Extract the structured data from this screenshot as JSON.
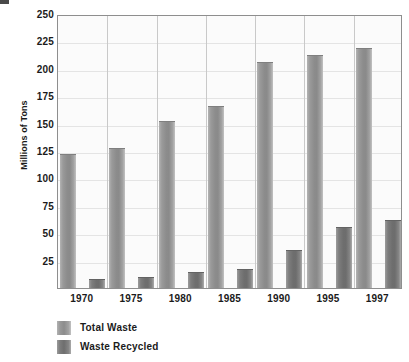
{
  "chart_data": {
    "type": "bar",
    "title": "",
    "xlabel": "",
    "ylabel": "Millions of Tons",
    "categories": [
      "1970",
      "1975",
      "1980",
      "1985",
      "1990",
      "1995",
      "1997"
    ],
    "series": [
      {
        "name": "Total Waste",
        "color": "#8c8c8c",
        "values": [
          122,
          128,
          152,
          166,
          206,
          213,
          219
        ]
      },
      {
        "name": "Waste Recycled",
        "color": "#6e6e6e",
        "values": [
          8,
          10,
          15,
          17,
          35,
          56,
          62
        ]
      }
    ],
    "ylim": [
      0,
      250
    ],
    "yticks": [
      250,
      225,
      200,
      175,
      150,
      125,
      100,
      75,
      50,
      25
    ],
    "ytick_labels": [
      "250",
      "225",
      "200",
      "175",
      "150",
      "125",
      "100",
      "75",
      "50",
      "25"
    ],
    "grid": true,
    "legend_position": "below-left",
    "plot_background": "#fbfbfb",
    "gridline_color": "#e4e4e4",
    "axis_color": "#8e8e8e"
  },
  "legend": {
    "items": [
      {
        "label": "Total Waste",
        "swatch": "total"
      },
      {
        "label": "Waste Recycled",
        "swatch": "recycled"
      }
    ]
  }
}
